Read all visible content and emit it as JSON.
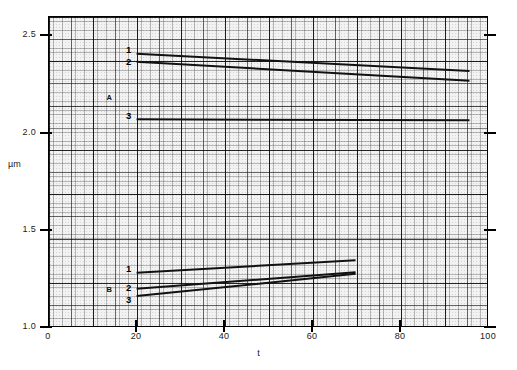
{
  "chart_data": {
    "type": "line",
    "title": "",
    "xlabel": "t",
    "ylabel": "µm",
    "xlim": [
      0,
      100
    ],
    "ylim": [
      1.0,
      2.6
    ],
    "xticks": [
      0,
      20,
      40,
      60,
      80,
      100
    ],
    "xtick_labels": [
      "0",
      "20",
      "40",
      "60",
      "80",
      "100"
    ],
    "yticks": [
      1.0,
      1.5,
      2.0,
      2.5
    ],
    "ytick_labels": [
      "1.0",
      "1.5",
      "2.0",
      "2.5"
    ],
    "grid": "graph-paper (fine 1-unit, medium 5-unit, coarse 10-unit)",
    "legend": "inline curve labels at left end of each line",
    "groups": [
      {
        "name": "A",
        "label": "A",
        "label_x": 14,
        "label_y": 2.19
      },
      {
        "name": "B",
        "label": "B",
        "label_x": 14,
        "label_y": 1.2
      }
    ],
    "series": [
      {
        "name": "A1",
        "group": "A",
        "label": "1",
        "points": [
          [
            20,
            2.41
          ],
          [
            96,
            2.32
          ]
        ]
      },
      {
        "name": "A2",
        "group": "A",
        "label": "2",
        "points": [
          [
            20,
            2.368
          ],
          [
            96,
            2.27
          ]
        ]
      },
      {
        "name": "A3",
        "group": "A",
        "label": "3",
        "points": [
          [
            20,
            2.07
          ],
          [
            96,
            2.065
          ]
        ]
      },
      {
        "name": "B1",
        "group": "B",
        "label": "1",
        "points": [
          [
            20,
            1.276
          ],
          [
            70,
            1.34
          ]
        ]
      },
      {
        "name": "B2",
        "group": "B",
        "label": "2",
        "points": [
          [
            20,
            1.193
          ],
          [
            70,
            1.278
          ]
        ]
      },
      {
        "name": "B3",
        "group": "B",
        "label": "3",
        "points": [
          [
            20,
            1.155
          ],
          [
            70,
            1.27
          ]
        ]
      }
    ]
  },
  "axes": {
    "x_label": "t",
    "y_label": "µm",
    "x_ticks": [
      "0",
      "20",
      "40",
      "60",
      "80",
      "100"
    ],
    "y_ticks": [
      "2.5",
      "2.0",
      "1.5",
      "1.0"
    ]
  },
  "annotations": {
    "a_group": "A",
    "b_group": "B",
    "a1": "1",
    "a2": "2",
    "a3": "3",
    "b1": "1",
    "b2": "2",
    "b3": "3"
  },
  "colors": {
    "curve": "#111111",
    "axis": "#000000",
    "paper": "#f2f2f2",
    "grid_fine": "#4a4a4a",
    "grid_coarse": "#2a2a2a",
    "background": "#ffffff"
  }
}
